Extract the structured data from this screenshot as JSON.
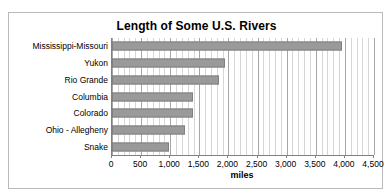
{
  "page": {
    "clipped_header_text": ""
  },
  "chart_data": {
    "type": "bar",
    "orientation": "horizontal",
    "title": "Length of Some U.S. Rivers",
    "xlabel": "miles",
    "ylabel": "",
    "categories": [
      "Mississippi-Missouri",
      "Yukon",
      "Rio Grande",
      "Columbia",
      "Colorado",
      "Ohio - Allegheny",
      "Snake"
    ],
    "values": [
      3950,
      1940,
      1840,
      1390,
      1390,
      1250,
      980
    ],
    "xlim": [
      0,
      4500
    ],
    "xticks": [
      0,
      500,
      1000,
      1500,
      2000,
      2500,
      3000,
      3500,
      4000,
      4500
    ],
    "xticklabels": [
      "0",
      "500",
      "1,000",
      "1,500",
      "2,000",
      "2,500",
      "3,000",
      "3,500",
      "4,000",
      "4,500"
    ],
    "minor_tick_step": 100,
    "grid": "vertical-minor-and-major",
    "legend": "none",
    "bar_color": "#9a9a9a",
    "bar_border_color": "#808080",
    "gridline_color": "#d6d6d6",
    "major_gridline_color": "#a6a6a6",
    "axis_color": "#808080",
    "plot_background": "#ffffff",
    "frame_border_color": "#b9b9b9"
  }
}
